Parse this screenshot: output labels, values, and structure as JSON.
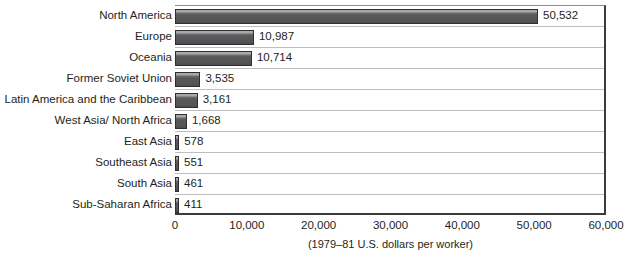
{
  "chart_data": {
    "type": "bar",
    "orientation": "horizontal",
    "title": "",
    "subtitle": "",
    "xlabel": "(1979–81 U.S. dollars per worker)",
    "ylabel": "",
    "categories": [
      "North America",
      "Europe",
      "Oceania",
      "Former Soviet Union",
      "Latin America and the Caribbean",
      "West Asia/ North Africa",
      "East Asia",
      "Southeast Asia",
      "South Asia",
      "Sub-Saharan Africa"
    ],
    "values": [
      50532,
      10987,
      10714,
      3535,
      3161,
      1668,
      578,
      551,
      461,
      411
    ],
    "value_labels": [
      "50,532",
      "10,987",
      "10,714",
      "3,535",
      "3,161",
      "1,668",
      "578",
      "551",
      "461",
      "411"
    ],
    "xlim": [
      0,
      60000
    ],
    "xticks": [
      0,
      10000,
      20000,
      30000,
      40000,
      50000,
      60000
    ],
    "xtick_labels": [
      "0",
      "10,000",
      "20,000",
      "30,000",
      "40,000",
      "50,000",
      "60,000"
    ],
    "grid": "horizontal",
    "legend": null,
    "colors": {
      "bar_top": "#a8a8aa",
      "bar_body": "#58585a",
      "bar_bottom": "#3f3f41",
      "bar_border": "#2f2f31",
      "gridline": "#bfbfbf",
      "axis": "#3b3b3b",
      "text": "#231f20",
      "background": "#ffffff"
    }
  }
}
